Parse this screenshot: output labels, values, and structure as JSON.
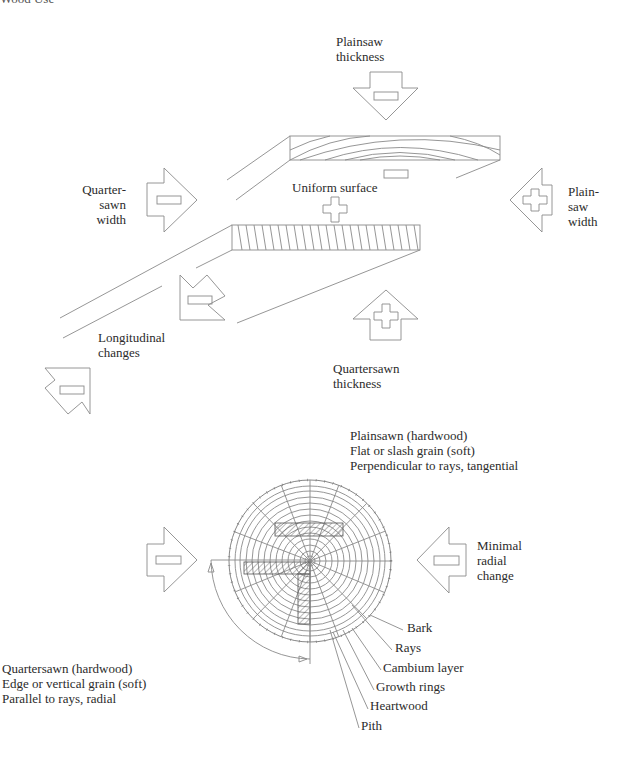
{
  "header": {
    "partial_title": "Wood Use"
  },
  "top_diagram": {
    "labels": {
      "plainsaw_thickness": [
        "Plainsaw",
        "thickness"
      ],
      "quartersawn_width": [
        "Quarter-",
        "sawn",
        "width"
      ],
      "uniform_surface": "Uniform surface",
      "plainsaw_width": [
        "Plain-",
        "saw",
        "width"
      ],
      "longitudinal_changes": [
        "Longitudinal",
        "changes"
      ],
      "quartersawn_thickness": [
        "Quartersawn",
        "thickness"
      ]
    },
    "arrows": [
      {
        "name": "plainsaw-thickness-arrow",
        "direction": "down",
        "sign": "minus"
      },
      {
        "name": "quartersawn-width-arrow",
        "direction": "right",
        "sign": "minus"
      },
      {
        "name": "plainsaw-width-arrow",
        "direction": "left",
        "sign": "plus"
      },
      {
        "name": "longitudinal-arrow",
        "direction": "diagonal",
        "sign": "minus"
      },
      {
        "name": "longitudinal-end-arrow",
        "direction": "diagonal",
        "sign": "minus"
      },
      {
        "name": "quartersawn-thickness-arrow",
        "direction": "up",
        "sign": "plus"
      }
    ],
    "symbols": {
      "plainsawn_board_face": "minus",
      "uniform_surface": "plus"
    }
  },
  "log_diagram": {
    "plainsawn_text": [
      "Plainsawn (hardwood)",
      "Flat or slash grain (soft)",
      "Perpendicular to rays, tangential"
    ],
    "quartersawn_text": [
      "Quartersawn (hardwood)",
      "Edge or vertical grain (soft)",
      "Parallel to rays, radial"
    ],
    "minimal_radial_change": [
      "Minimal",
      "radial",
      "change"
    ],
    "parts": [
      "Bark",
      "Rays",
      "Cambium layer",
      "Growth rings",
      "Heartwood",
      "Pith"
    ],
    "arrows": [
      {
        "name": "quartersawn-arrow",
        "direction": "right",
        "sign": "minus"
      },
      {
        "name": "radial-arrow",
        "direction": "left",
        "sign": "minus"
      }
    ]
  }
}
